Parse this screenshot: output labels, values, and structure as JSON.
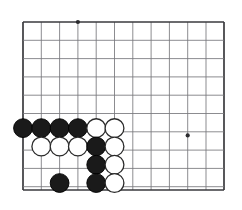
{
  "page": {
    "type": "go-board-diagram",
    "caption": "",
    "background_color": "#ffffff"
  },
  "board": {
    "name": "go-board",
    "view": "bottom-left-corner",
    "origin_x": 23,
    "origin_y": 22,
    "spacing": 18.3,
    "cols": 11,
    "rows": 9,
    "left_edge_x": 23,
    "top_edge_y": 22,
    "right_edge_x": 224,
    "bottom_edge_y": 190,
    "line_color": "#77777c",
    "edge_color": "#3a3a3e",
    "star_points": [
      {
        "col": 3,
        "row": 0
      },
      {
        "col": 9,
        "row": 6.2
      }
    ],
    "stones": [
      {
        "col": 0,
        "row": 5.8,
        "color": "black"
      },
      {
        "col": 1,
        "row": 5.8,
        "color": "black"
      },
      {
        "col": 2,
        "row": 5.8,
        "color": "black"
      },
      {
        "col": 3,
        "row": 5.8,
        "color": "black"
      },
      {
        "col": 4,
        "row": 5.8,
        "color": "white"
      },
      {
        "col": 5,
        "row": 5.8,
        "color": "white"
      },
      {
        "col": 1,
        "row": 6.8,
        "color": "white"
      },
      {
        "col": 2,
        "row": 6.8,
        "color": "white"
      },
      {
        "col": 3,
        "row": 6.8,
        "color": "white"
      },
      {
        "col": 4,
        "row": 6.8,
        "color": "black"
      },
      {
        "col": 5,
        "row": 6.8,
        "color": "white"
      },
      {
        "col": 4,
        "row": 7.8,
        "color": "black"
      },
      {
        "col": 5,
        "row": 7.8,
        "color": "white"
      },
      {
        "col": 2,
        "row": 8.8,
        "color": "black"
      },
      {
        "col": 4,
        "row": 8.8,
        "color": "black"
      },
      {
        "col": 5,
        "row": 8.8,
        "color": "white"
      }
    ],
    "stone_radius": 9.4,
    "black_color": "#1a1a1a",
    "white_color": "#ffffff"
  }
}
